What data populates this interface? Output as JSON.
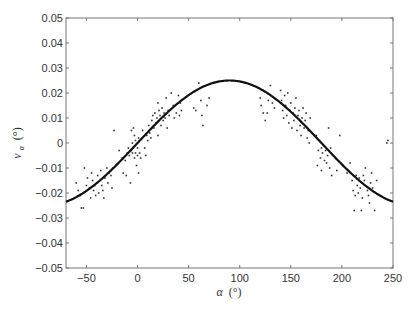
{
  "chart_data": {
    "type": "scatter",
    "title": "",
    "xlabel": "α (°)",
    "ylabel": "v_α (°)",
    "xlabel_symbol": "α",
    "xlabel_unit": "(°)",
    "ylabel_symbol": "v",
    "ylabel_subscript": "α",
    "ylabel_unit": "(°)",
    "xlim": [
      -70,
      250
    ],
    "ylim": [
      -0.05,
      0.05
    ],
    "xticks": [
      -50,
      0,
      50,
      100,
      150,
      200,
      250
    ],
    "xtick_labels": [
      "−50",
      "0",
      "50",
      "100",
      "150",
      "200",
      "250"
    ],
    "yticks": [
      0.05,
      0.04,
      0.03,
      0.02,
      0.01,
      0,
      -0.01,
      -0.02,
      -0.03,
      -0.04,
      -0.05
    ],
    "ytick_labels": [
      "0.05",
      "0.04",
      "0.03",
      "0.02",
      "0.01",
      "0",
      "−0.01",
      "−0.02",
      "−0.03",
      "−0.04",
      "−0.05"
    ],
    "grid": false,
    "legend": "none",
    "series": [
      {
        "name": "fit",
        "type": "line",
        "model": "0.025*sin(alpha)",
        "amplitude": 0.025,
        "color": "#111111"
      },
      {
        "name": "measurements",
        "type": "scatter",
        "color": "#333333",
        "points": [
          [
            -60,
            -0.016
          ],
          [
            -58,
            -0.019
          ],
          [
            -56,
            -0.021
          ],
          [
            -55,
            -0.026
          ],
          [
            -53,
            -0.026
          ],
          [
            -52,
            -0.01
          ],
          [
            -50,
            -0.017
          ],
          [
            -49,
            -0.014
          ],
          [
            -47,
            -0.018
          ],
          [
            -46,
            -0.022
          ],
          [
            -45,
            -0.012
          ],
          [
            -44,
            -0.015
          ],
          [
            -43,
            -0.019
          ],
          [
            -42,
            -0.017
          ],
          [
            -41,
            -0.021
          ],
          [
            -40,
            -0.016
          ],
          [
            -39,
            -0.013
          ],
          [
            -38,
            -0.02
          ],
          [
            -36,
            -0.011
          ],
          [
            -35,
            -0.017
          ],
          [
            -34,
            -0.019
          ],
          [
            -33,
            -0.022
          ],
          [
            -32,
            -0.014
          ],
          [
            -30,
            -0.01
          ],
          [
            -29,
            -0.016
          ],
          [
            -28,
            -0.012
          ],
          [
            -26,
            -0.013
          ],
          [
            -25,
            -0.018
          ],
          [
            -24,
            -0.01
          ],
          [
            -23,
            0.005
          ],
          [
            -18,
            -0.003
          ],
          [
            -15,
            -0.006
          ],
          [
            -14,
            -0.012
          ],
          [
            -12,
            -0.007
          ],
          [
            -11,
            -0.013
          ],
          [
            -10,
            -0.004
          ],
          [
            -9,
            -0.002
          ],
          [
            -8,
            -0.005
          ],
          [
            -7,
            -0.016
          ],
          [
            -6,
            0.005
          ],
          [
            -6,
            -0.003
          ],
          [
            -5,
            0.0
          ],
          [
            -5,
            -0.004
          ],
          [
            -4,
            0.006
          ],
          [
            -4,
            -0.002
          ],
          [
            -3,
            0.003
          ],
          [
            -3,
            -0.006
          ],
          [
            -2,
            0.001
          ],
          [
            -2,
            -0.004
          ],
          [
            -1,
            -0.009
          ],
          [
            0,
            -0.002
          ],
          [
            0,
            -0.005
          ],
          [
            1,
            0.002
          ],
          [
            1,
            -0.012
          ],
          [
            2,
            -0.004
          ],
          [
            3,
            -0.006
          ],
          [
            5,
            0.005
          ],
          [
            7,
            -0.002
          ],
          [
            8,
            -0.005
          ],
          [
            9,
            0.003
          ],
          [
            10,
            0.001
          ],
          [
            11,
            0.007
          ],
          [
            12,
            0.004
          ],
          [
            13,
            0.002
          ],
          [
            14,
            0.009
          ],
          [
            15,
            0.011
          ],
          [
            16,
            0.006
          ],
          [
            17,
            0.012
          ],
          [
            18,
            0.008
          ],
          [
            19,
            0.01
          ],
          [
            20,
            0.016
          ],
          [
            20,
            0.003
          ],
          [
            21,
            0.013
          ],
          [
            22,
            0.011
          ],
          [
            23,
            0.007
          ],
          [
            24,
            0.014
          ],
          [
            25,
            0.009
          ],
          [
            26,
            0.012
          ],
          [
            27,
            0.01
          ],
          [
            28,
            0.018
          ],
          [
            29,
            0.006
          ],
          [
            30,
            0.013
          ],
          [
            31,
            0.011
          ],
          [
            33,
            0.02
          ],
          [
            35,
            0.015
          ],
          [
            36,
            0.01
          ],
          [
            38,
            0.012
          ],
          [
            40,
            0.019
          ],
          [
            41,
            0.011
          ],
          [
            42,
            0.016
          ],
          [
            43,
            0.013
          ],
          [
            55,
            0.014
          ],
          [
            57,
            0.013
          ],
          [
            60,
            0.024
          ],
          [
            62,
            0.017
          ],
          [
            63,
            0.011
          ],
          [
            64,
            0.007
          ],
          [
            68,
            0.015
          ],
          [
            70,
            0.018
          ],
          [
            120,
            0.018
          ],
          [
            121,
            0.015
          ],
          [
            123,
            0.012
          ],
          [
            125,
            0.009
          ],
          [
            127,
            0.012
          ],
          [
            128,
            0.017
          ],
          [
            130,
            0.023
          ],
          [
            132,
            0.016
          ],
          [
            134,
            0.014
          ],
          [
            140,
            0.021
          ],
          [
            141,
            0.017
          ],
          [
            142,
            0.013
          ],
          [
            143,
            0.01
          ],
          [
            144,
            0.019
          ],
          [
            145,
            0.015
          ],
          [
            146,
            0.011
          ],
          [
            147,
            0.02
          ],
          [
            148,
            0.008
          ],
          [
            149,
            0.013
          ],
          [
            150,
            0.016
          ],
          [
            151,
            0.006
          ],
          [
            152,
            0.012
          ],
          [
            153,
            0.009
          ],
          [
            154,
            0.014
          ],
          [
            155,
            0.018
          ],
          [
            156,
            0.005
          ],
          [
            157,
            0.011
          ],
          [
            158,
            0.013
          ],
          [
            159,
            0.007
          ],
          [
            160,
            0.003
          ],
          [
            161,
            0.01
          ],
          [
            162,
            0.014
          ],
          [
            163,
            0.006
          ],
          [
            164,
            0.009
          ],
          [
            165,
            0.012
          ],
          [
            166,
            0.002
          ],
          [
            167,
            0.005
          ],
          [
            168,
            0.0
          ],
          [
            169,
            0.01
          ],
          [
            175,
            0.003
          ],
          [
            176,
            -0.009
          ],
          [
            177,
            -0.003
          ],
          [
            178,
            0.001
          ],
          [
            179,
            -0.006
          ],
          [
            180,
            -0.002
          ],
          [
            180,
            -0.011
          ],
          [
            181,
            -0.004
          ],
          [
            182,
            -0.001
          ],
          [
            183,
            -0.007
          ],
          [
            184,
            -0.003
          ],
          [
            185,
            -0.008
          ],
          [
            186,
            -0.005
          ],
          [
            187,
            0.006
          ],
          [
            188,
            -0.01
          ],
          [
            189,
            -0.002
          ],
          [
            190,
            -0.013
          ],
          [
            195,
            -0.011
          ],
          [
            198,
            0.003
          ],
          [
            205,
            -0.012
          ],
          [
            208,
            -0.008
          ],
          [
            210,
            -0.015
          ],
          [
            211,
            -0.019
          ],
          [
            212,
            -0.027
          ],
          [
            213,
            -0.021
          ],
          [
            214,
            -0.013
          ],
          [
            215,
            -0.017
          ],
          [
            216,
            -0.02
          ],
          [
            217,
            -0.014
          ],
          [
            218,
            -0.018
          ],
          [
            219,
            -0.027
          ],
          [
            220,
            -0.022
          ],
          [
            221,
            -0.013
          ],
          [
            222,
            -0.015
          ],
          [
            223,
            -0.01
          ],
          [
            225,
            -0.019
          ],
          [
            226,
            -0.021
          ],
          [
            227,
            -0.024
          ],
          [
            228,
            -0.016
          ],
          [
            229,
            -0.012
          ],
          [
            230,
            -0.018
          ],
          [
            232,
            -0.027
          ],
          [
            234,
            -0.015
          ],
          [
            244,
            0.0
          ],
          [
            245,
            0.001
          ]
        ]
      }
    ]
  }
}
